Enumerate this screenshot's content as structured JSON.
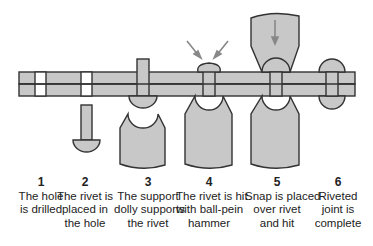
{
  "diagram": {
    "colors": {
      "fill": "#c8c8c8",
      "stroke": "#333333",
      "arrow": "#888888",
      "text": "#222222"
    },
    "steps": [
      {
        "number": "1",
        "lines": [
          "The hole",
          "is drilled"
        ]
      },
      {
        "number": "2",
        "lines": [
          "The rivet is",
          "placed in",
          "the hole"
        ]
      },
      {
        "number": "3",
        "lines": [
          "The support",
          "dolly supports",
          "the rivet"
        ]
      },
      {
        "number": "4",
        "lines": [
          "The rivet is hit",
          "with ball-pein",
          "hammer"
        ]
      },
      {
        "number": "5",
        "lines": [
          "Snap is placed",
          "over rivet",
          "and hit"
        ]
      },
      {
        "number": "6",
        "lines": [
          "Riveted",
          "joint is",
          "complete"
        ]
      }
    ]
  }
}
